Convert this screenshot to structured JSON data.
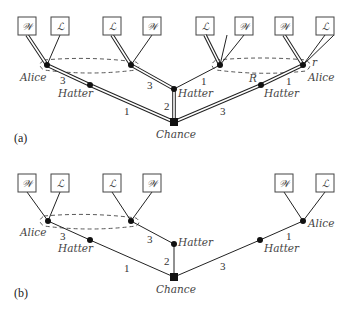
{
  "figure": {
    "panels": [
      {
        "id": "a",
        "label": "(a)",
        "leaves": [
          "𝒲",
          "ℒ",
          "ℒ",
          "𝒲",
          "ℒ",
          "𝒲",
          "𝒲",
          "ℒ"
        ],
        "nodes": {
          "alice_left": "Alice",
          "hatter_left": "Hatter",
          "hatter_center": "Hatter",
          "chance": "Chance",
          "hatter_right": "Hatter",
          "alice_right": "Alice"
        },
        "edge_labels": {
          "alice_to_hatter": "3",
          "hatter_left_to_chance": "1",
          "node2_to_hatter_center": "3",
          "hatter_center_to_chance": "2",
          "hatter_center_to_node3": "1",
          "chance_to_hatter_right": "3",
          "hatter_right_to_alice": "1",
          "strategy_R": "R",
          "strategy_r": "r"
        }
      },
      {
        "id": "b",
        "label": "(b)",
        "leaves": [
          "𝒲",
          "ℒ",
          "ℒ",
          "𝒲",
          "𝒲",
          "ℒ"
        ],
        "nodes": {
          "alice_left": "Alice",
          "hatter_left": "Hatter",
          "hatter_center": "Hatter",
          "chance": "Chance",
          "hatter_right": "Hatter",
          "alice_right": "Alice"
        },
        "edge_labels": {
          "alice_to_hatter": "3",
          "hatter_left_to_chance": "1",
          "node2_to_hatter_center": "3",
          "hatter_center_to_chance": "2",
          "chance_to_hatter_right": "3",
          "hatter_right_to_alice": "1"
        }
      }
    ]
  }
}
